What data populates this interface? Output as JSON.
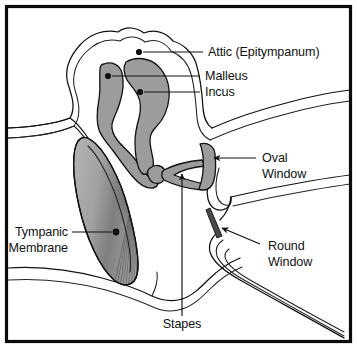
{
  "figure": {
    "background_color": "#ffffff",
    "frame_color": "#0b0b0b",
    "ink_color": "#111111",
    "bone_fill_color": "#9c9c9c",
    "membrane_fill_color": "#8f8f8f"
  },
  "labels": {
    "attic": "Attic (Epitympanum)",
    "malleus": "Malleus",
    "incus": "Incus",
    "oval_window_line1": "Oval",
    "oval_window_line2": "Window",
    "round_window_line1": "Round",
    "round_window_line2": "Window",
    "tympanic_membrane_line1": "Tympanic",
    "tympanic_membrane_line2": "Membrane",
    "stapes": "Stapes"
  },
  "structures": [
    {
      "name": "attic",
      "label": "Attic (Epitympanum)",
      "marker": "dot",
      "marker_x": 138,
      "marker_y": 52
    },
    {
      "name": "malleus",
      "label": "Malleus",
      "marker": "dot",
      "marker_x": 107,
      "marker_y": 76
    },
    {
      "name": "incus",
      "label": "Incus",
      "marker": "dot",
      "marker_x": 139,
      "marker_y": 92
    },
    {
      "name": "oval-window",
      "label": "Oval Window",
      "marker": "arrow",
      "marker_x": 212,
      "marker_y": 158
    },
    {
      "name": "round-window",
      "label": "Round Window",
      "marker": "arrow",
      "marker_x": 222,
      "marker_y": 227
    },
    {
      "name": "tympanic-membrane",
      "label": "Tympanic Membrane",
      "marker": "dot",
      "marker_x": 116,
      "marker_y": 232
    },
    {
      "name": "stapes",
      "label": "Stapes",
      "marker": "arrow",
      "marker_x": 182,
      "marker_y": 172
    }
  ]
}
